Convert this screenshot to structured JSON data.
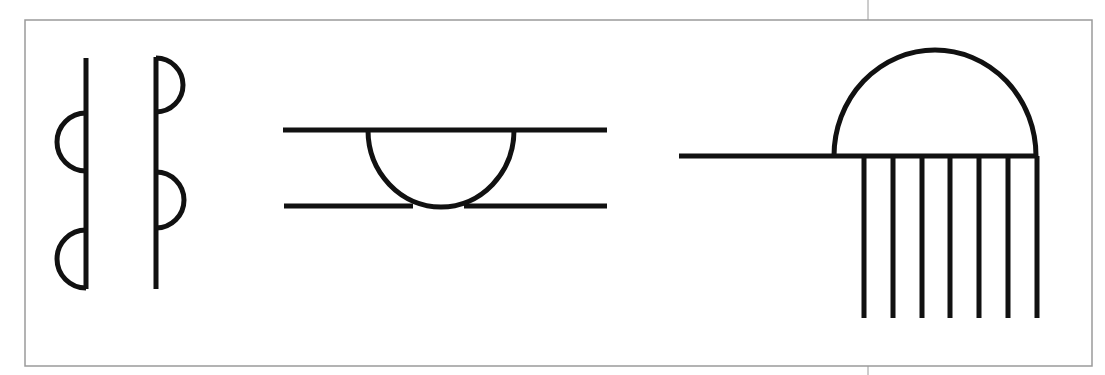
{
  "canvas": {
    "width": 1105,
    "height": 375,
    "background": "#ffffff"
  },
  "colors": {
    "stroke": "#111111",
    "frame": "#9a9a9a"
  },
  "frame": {
    "x": 25,
    "y": 20,
    "width": 1067,
    "height": 346,
    "stroke_width": 1.5,
    "divider": {
      "x": 868,
      "top_y1": 0,
      "top_y2": 20,
      "bottom_y1": 366,
      "bottom_y2": 375,
      "stroke_width": 1
    }
  },
  "symbols": [
    {
      "id": "left-vertical-with-semicircles",
      "description": "Vertical line with two semicircles bulging left",
      "stroke_width": 5,
      "lines": [
        {
          "x1": 86,
          "y1": 58,
          "x2": 86,
          "y2": 289
        }
      ],
      "semicircles": [
        {
          "cx": 86,
          "cy": 142,
          "r": 29,
          "side": "left"
        },
        {
          "cx": 86,
          "cy": 259,
          "r": 29,
          "side": "left"
        }
      ]
    },
    {
      "id": "right-vertical-with-semicircles",
      "description": "Vertical line with two semicircles bulging right",
      "stroke_width": 5,
      "lines": [
        {
          "x1": 156,
          "y1": 57,
          "x2": 156,
          "y2": 289
        }
      ],
      "semicircles": [
        {
          "cx": 156,
          "cy": 85,
          "r": 27,
          "side": "right"
        },
        {
          "cx": 156,
          "cy": 200,
          "r": 28,
          "side": "right"
        }
      ]
    },
    {
      "id": "double-line-with-sagging-semicircle",
      "description": "Two horizontal lines with a semicircle hanging from the top line down to the bottom line",
      "stroke_width": 5,
      "lines": [
        {
          "x1": 283,
          "y1": 130,
          "x2": 607,
          "y2": 130
        },
        {
          "x1": 284,
          "y1": 206,
          "x2": 413,
          "y2": 206
        },
        {
          "x1": 464,
          "y1": 206,
          "x2": 607,
          "y2": 206
        }
      ],
      "arcs": [
        {
          "x1": 368,
          "y1": 130,
          "x2": 514,
          "y2": 130,
          "rx": 73,
          "ry": 77,
          "sweep": 0
        }
      ]
    },
    {
      "id": "dome-with-comb",
      "description": "Horizontal line with a dome above the right portion and seven vertical teeth below",
      "stroke_width": 5,
      "lines": [
        {
          "x1": 679,
          "y1": 156,
          "x2": 1038,
          "y2": 156
        }
      ],
      "arcs": [
        {
          "x1": 834,
          "y1": 156,
          "x2": 1036,
          "y2": 156,
          "rx": 101,
          "ry": 106,
          "sweep": 1
        }
      ],
      "teeth": {
        "xs": [
          864,
          893,
          922,
          950,
          979,
          1008,
          1037
        ],
        "y1": 156,
        "y2": 318
      }
    }
  ]
}
